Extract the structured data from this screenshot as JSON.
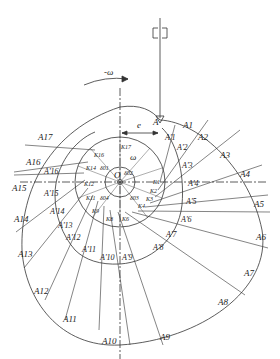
{
  "diagram": {
    "colors": {
      "line": "#333333",
      "background": "#ffffff"
    },
    "symbols": {
      "omega": "ω",
      "minus_omega": "-ω",
      "offset": "e",
      "center": "O"
    },
    "outer_points": [
      "A",
      "A1",
      "A2",
      "A3",
      "A4",
      "A5",
      "A6",
      "A7",
      "A8",
      "A9",
      "A10",
      "A11",
      "A12",
      "A13",
      "A14",
      "A15",
      "A16",
      "A17"
    ],
    "profile_points": [
      "A'1",
      "A'2",
      "A'3",
      "A'4",
      "A'5",
      "A'6",
      "A'7",
      "A'8",
      "A'9",
      "A'10",
      "A'11",
      "A'12",
      "A'13",
      "A'14",
      "A'15",
      "A'16"
    ],
    "tangent_points": [
      "K1",
      "K2",
      "K3",
      "K4",
      "K5",
      "K6",
      "K7",
      "K8",
      "K9",
      "K10",
      "K11",
      "K12",
      "K13",
      "K14",
      "K15",
      "K16",
      "K17"
    ],
    "angle_labels": [
      "δ01",
      "δ02",
      "δ03",
      "δ04"
    ]
  }
}
